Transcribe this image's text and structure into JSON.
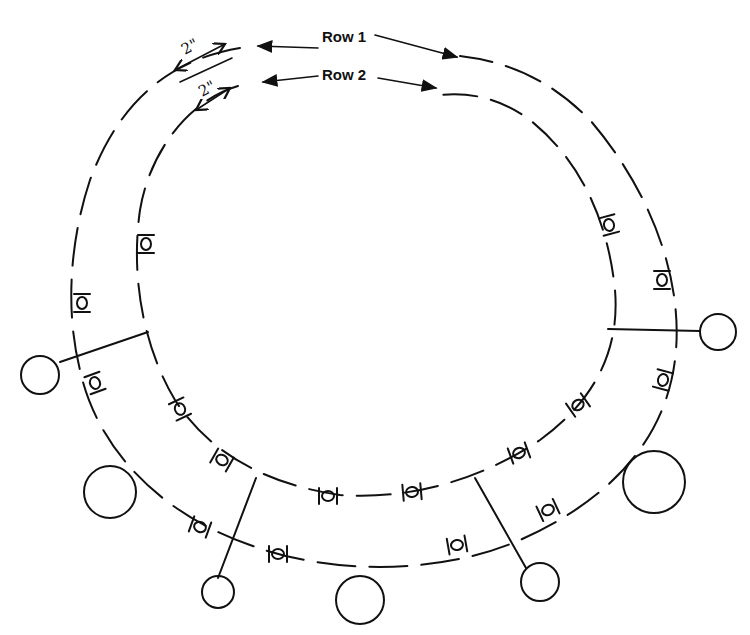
{
  "diagram": {
    "type": "hand-drawn pattern diagram",
    "colors": {
      "ink": "#111111",
      "background": "#ffffff"
    },
    "labels": {
      "row1": "Row 1",
      "row2": "Row 2",
      "spacing_row1": "2\"",
      "spacing_row2": "2\""
    },
    "rows": [
      {
        "name": "Row 1",
        "shape": "outer oval of dashed segments with bead units",
        "spacing": "2\""
      },
      {
        "name": "Row 2",
        "shape": "inner oval of dashed segments with bead units",
        "spacing": "2\""
      }
    ],
    "symbols": {
      "bead_unit": "|O|",
      "divider": "| |"
    },
    "pendant_circles": [
      {
        "position": "left",
        "size": "small",
        "connector": "line"
      },
      {
        "position": "lower-left",
        "size": "large",
        "connector": "none"
      },
      {
        "position": "bottom-left",
        "size": "small",
        "connector": "line"
      },
      {
        "position": "bottom-center",
        "size": "large",
        "connector": "none"
      },
      {
        "position": "bottom-right",
        "size": "small",
        "connector": "line"
      },
      {
        "position": "lower-right",
        "size": "large",
        "connector": "none"
      },
      {
        "position": "right",
        "size": "small",
        "connector": "line"
      }
    ]
  }
}
